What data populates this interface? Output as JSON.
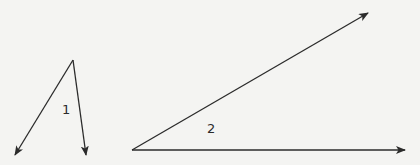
{
  "diagram": {
    "type": "angles",
    "stroke_color": "#2b2b2b",
    "background_color": "#f4f4f2",
    "angles": [
      {
        "label": "1",
        "vertex": [
          73,
          60
        ],
        "rays": [
          {
            "end": [
              15,
              155
            ]
          },
          {
            "end": [
              86,
              155
            ]
          }
        ],
        "label_pos": [
          62,
          114
        ]
      },
      {
        "label": "2",
        "vertex": [
          132,
          150
        ],
        "rays": [
          {
            "end": [
              368,
              13
            ]
          },
          {
            "end": [
              405,
              150
            ]
          }
        ],
        "label_pos": [
          207,
          133
        ]
      }
    ]
  }
}
